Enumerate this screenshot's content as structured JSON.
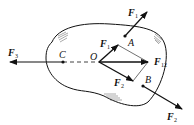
{
  "diagram": {
    "type": "rigid-body-force-diagram",
    "points": {
      "O": {
        "label": "O",
        "x": 99,
        "y": 62
      },
      "A": {
        "label": "A",
        "x": 125,
        "y": 36
      },
      "B": {
        "label": "B",
        "x": 143,
        "y": 86
      },
      "C": {
        "label": "C",
        "x": 63,
        "y": 62
      }
    },
    "forces": {
      "F1_at_A": {
        "base": "F",
        "sub": "1"
      },
      "F1_at_O": {
        "base": "F",
        "sub": "1"
      },
      "F2_at_O": {
        "base": "F",
        "sub": "2"
      },
      "F2_at_B": {
        "base": "F",
        "sub": "2"
      },
      "F12": {
        "base": "F",
        "sub": "12"
      },
      "F3": {
        "base": "F",
        "sub": "3"
      }
    },
    "colors": {
      "stroke": "#111111",
      "background": "#ffffff"
    }
  }
}
